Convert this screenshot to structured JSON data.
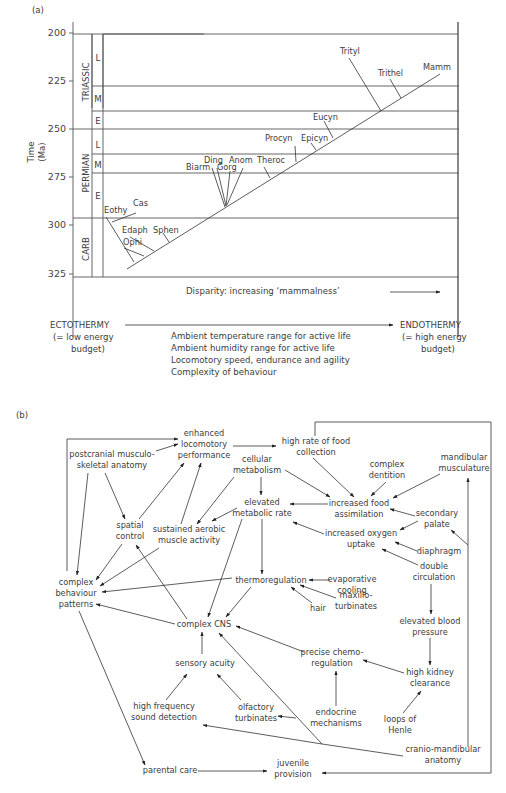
{
  "panel_a": {
    "label": "(a)",
    "y_axis_label_1": "Time",
    "y_axis_label_2": "(Ma)",
    "y_ticks": [
      "200",
      "225",
      "250",
      "275",
      "300",
      "325"
    ],
    "periods": [
      "TRIASSIC",
      "PERMIAN",
      "CARB"
    ],
    "epochs": {
      "tri_l": "L",
      "tri_m": "M",
      "tri_e": "E",
      "perm_l": "L",
      "perm_m": "M",
      "perm_e": "E"
    },
    "taxa": {
      "eothy": "Eothy",
      "cas": "Cas",
      "edaph": "Edaph",
      "sphen": "Sphen",
      "ophi": "Ophi",
      "biarm": "Biarm",
      "ding": "Ding",
      "gorg": "Gorg",
      "anom": "Anom",
      "theroc": "Theroc",
      "procyn": "Procyn",
      "epicyn": "Epicyn",
      "eucyn": "Eucyn",
      "trityl": "Trityl",
      "trithel": "Trithel",
      "mamm": "Mamm"
    },
    "x_axis_label": "Disparity: increasing ‘mammalness’"
  },
  "gradient": {
    "left_1": "ECTOTHERMY",
    "left_2": "(= low energy",
    "left_3": "budget)",
    "right_1": "ENDOTHERMY",
    "right_2": "(= high energy",
    "right_3": "budget)",
    "items": [
      "Ambient temperature range for active life",
      "Ambient humidity range for active life",
      "Locomotory speed, endurance and agility",
      "Complexity of behaviour"
    ]
  },
  "panel_b": {
    "label": "(b)",
    "nodes": {
      "enhanced_1": "enhanced",
      "enhanced_2": "locomotory",
      "enhanced_3": "performance",
      "highrate_1": "high rate of food",
      "highrate_2": "collection",
      "postcranial_1": "postcranial musculo-",
      "postcranial_2": "skeletal anatomy",
      "cellular_1": "cellular",
      "cellular_2": "metabolism",
      "complexdent_1": "complex",
      "complexdent_2": "dentition",
      "mandmusc_1": "mandibular",
      "mandmusc_2": "musculature",
      "elevmet_1": "elevated",
      "elevmet_2": "metabolic rate",
      "incfood_1": "increased food",
      "incfood_2": "assimilation",
      "spatial_1": "spatial",
      "spatial_2": "control",
      "sustained_1": "sustained aerobic",
      "sustained_2": "muscle activity",
      "secpal_1": "secondary",
      "secpal_2": "palate",
      "incoxy_1": "increased oxygen",
      "incoxy_2": "uptake",
      "diaphragm": "diaphragm",
      "doublecirc_1": "double",
      "doublecirc_2": "circulation",
      "complexbeh_1": "complex",
      "complexbeh_2": "behaviour",
      "complexbeh_3": "patterns",
      "thermoreg": "thermoregulation",
      "evap_1": "evaporative",
      "evap_2": "cooling",
      "maxillo_1": "maxillo-",
      "maxillo_2": "turbinates",
      "hair": "hair",
      "elevblood_1": "elevated blood",
      "elevblood_2": "pressure",
      "cns": "complex CNS",
      "chemo_1": "precise chemo-",
      "chemo_2": "regulation",
      "kidney_1": "high kidney",
      "kidney_2": "clearance",
      "sensory": "sensory acuity",
      "endocrine_1": "endocrine",
      "endocrine_2": "mechanisms",
      "highfreq_1": "high frequency",
      "highfreq_2": "sound detection",
      "olfactory_1": "olfactory",
      "olfactory_2": "turbinates",
      "loops_1": "loops of",
      "loops_2": "Henle",
      "cranio_1": "cranio-mandibular",
      "cranio_2": "anatomy",
      "parental": "parental care",
      "juvenile_1": "juvenile",
      "juvenile_2": "provision"
    }
  }
}
